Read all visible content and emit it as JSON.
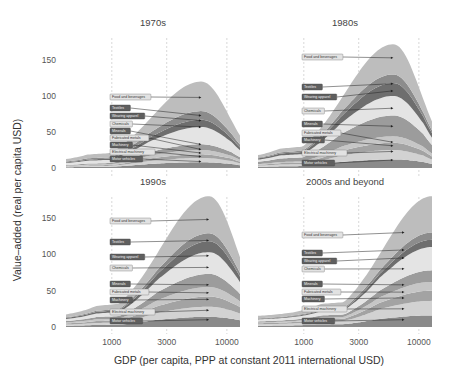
{
  "chart_data": {
    "type": "area",
    "subtype": "stacked-area-faceted",
    "xlabel": "GDP (per capita, PPP at constant 2011 international USD)",
    "ylabel": "Value–added (real per capita USD)",
    "x_scale": "log",
    "x_ticks": [
      1000,
      3000,
      10000
    ],
    "x_tick_labels": [
      "1000",
      "3000",
      "10000"
    ],
    "y_ticks": [
      0,
      50,
      100,
      150
    ],
    "y_tick_labels": [
      "0",
      "50",
      "100",
      "150"
    ],
    "ylim": [
      0,
      175
    ],
    "xlim": [
      400,
      13000
    ],
    "grid": "vertical dashed at x ticks",
    "legend": "inline labels with arrows",
    "series_order_bottom_to_top": [
      "Motor vehicles",
      "Electrical machinery",
      "Machinery",
      "Fabricated metals",
      "Minerals",
      "Chemicals",
      "Wearing apparel",
      "Textiles",
      "Food and beverages"
    ],
    "series_colors": {
      "Motor vehicles": "#8a8a8a",
      "Electrical machinery": "#d2d2d2",
      "Machinery": "#a3a3a3",
      "Fabricated metals": "#c6c6c6",
      "Minerals": "#9c9c9c",
      "Chemicals": "#e4e4e4",
      "Wearing apparel": "#6e6e6e",
      "Textiles": "#8c8c8c",
      "Food and beverages": "#bdbdbd"
    },
    "x": [
      400,
      700,
      1000,
      1500,
      2000,
      3000,
      4000,
      5000,
      6000,
      7000,
      8000,
      10000,
      13000
    ],
    "panels": [
      {
        "title": "1970s",
        "peak_x": 6000,
        "cumulative_top_at_peak": [
          8,
          14,
          19,
          25,
          33,
          57,
          67,
          79,
          120
        ],
        "arrow_targets_y": [
          9,
          16,
          21,
          26,
          33,
          57,
          66,
          73,
          98
        ],
        "series": [
          {
            "name": "Motor vehicles",
            "values_at_peak": 8
          },
          {
            "name": "Electrical machinery",
            "values_at_peak": 6
          },
          {
            "name": "Machinery",
            "values_at_peak": 5
          },
          {
            "name": "Fabricated metals",
            "values_at_peak": 6
          },
          {
            "name": "Minerals",
            "values_at_peak": 8
          },
          {
            "name": "Chemicals",
            "values_at_peak": 24
          },
          {
            "name": "Wearing apparel",
            "values_at_peak": 10
          },
          {
            "name": "Textiles",
            "values_at_peak": 12
          },
          {
            "name": "Food and beverages",
            "values_at_peak": 41
          }
        ]
      },
      {
        "title": "1980s",
        "peak_x": 6000,
        "cumulative_top_at_peak": [
          12,
          25,
          35,
          44,
          73,
          100,
          118,
          130,
          172
        ],
        "arrow_targets_y": [
          11,
          23,
          31,
          36,
          58,
          83,
          107,
          117,
          153
        ],
        "series": [
          {
            "name": "Motor vehicles",
            "values_at_peak": 12
          },
          {
            "name": "Electrical machinery",
            "values_at_peak": 13
          },
          {
            "name": "Machinery",
            "values_at_peak": 10
          },
          {
            "name": "Fabricated metals",
            "values_at_peak": 9
          },
          {
            "name": "Minerals",
            "values_at_peak": 29
          },
          {
            "name": "Chemicals",
            "values_at_peak": 27
          },
          {
            "name": "Wearing apparel",
            "values_at_peak": 18
          },
          {
            "name": "Textiles",
            "values_at_peak": 12
          },
          {
            "name": "Food and beverages",
            "values_at_peak": 42
          }
        ]
      },
      {
        "title": "1990s",
        "peak_x": 7000,
        "cumulative_top_at_peak": [
          14,
          28,
          42,
          55,
          73,
          103,
          118,
          129,
          180
        ],
        "arrow_targets_y": [
          10,
          23,
          38,
          47,
          58,
          82,
          98,
          119,
          148
        ],
        "series": [
          {
            "name": "Motor vehicles",
            "values_at_peak": 14
          },
          {
            "name": "Electrical machinery",
            "values_at_peak": 14
          },
          {
            "name": "Machinery",
            "values_at_peak": 14
          },
          {
            "name": "Fabricated metals",
            "values_at_peak": 13
          },
          {
            "name": "Minerals",
            "values_at_peak": 18
          },
          {
            "name": "Chemicals",
            "values_at_peak": 30
          },
          {
            "name": "Wearing apparel",
            "values_at_peak": 15
          },
          {
            "name": "Textiles",
            "values_at_peak": 11
          },
          {
            "name": "Food and beverages",
            "values_at_peak": 51
          }
        ]
      },
      {
        "title": "2000s and beyond",
        "peak_x": 13000,
        "cumulative_top_at_peak": [
          16,
          36,
          50,
          62,
          78,
          110,
          120,
          130,
          180
        ],
        "arrow_targets_y": [
          10,
          25,
          40,
          48,
          58,
          80,
          95,
          106,
          130
        ],
        "series": [
          {
            "name": "Motor vehicles",
            "values_at_peak": 16
          },
          {
            "name": "Electrical machinery",
            "values_at_peak": 20
          },
          {
            "name": "Machinery",
            "values_at_peak": 14
          },
          {
            "name": "Fabricated metals",
            "values_at_peak": 12
          },
          {
            "name": "Minerals",
            "values_at_peak": 16
          },
          {
            "name": "Chemicals",
            "values_at_peak": 32
          },
          {
            "name": "Wearing apparel",
            "values_at_peak": 10
          },
          {
            "name": "Textiles",
            "values_at_peak": 10
          },
          {
            "name": "Food and beverages",
            "values_at_peak": 50
          }
        ]
      }
    ]
  },
  "labels": {
    "series_names": [
      "Food and beverages",
      "Textiles",
      "Wearing apparel",
      "Chemicals",
      "Minerals",
      "Fabricated metals",
      "Machinery",
      "Electrical machinery",
      "Motor vehicles"
    ],
    "dark_label_series": [
      "Textiles",
      "Wearing apparel",
      "Minerals",
      "Machinery",
      "Motor vehicles"
    ]
  }
}
